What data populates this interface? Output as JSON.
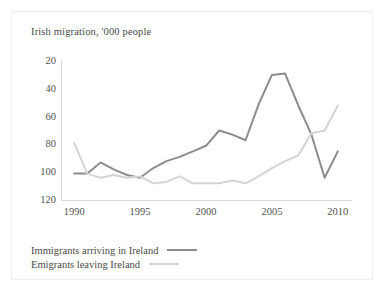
{
  "figure": {
    "title": "Irish migration, '000 people"
  },
  "legend": {
    "items": [
      {
        "label": "Immigrants arriving in Ireland",
        "color": "#8e8c8a",
        "swatch": "thick-line-swatch"
      },
      {
        "label": "Emigrants leaving Ireland",
        "color": "#d6d4d1",
        "swatch": "thin-line-swatch"
      }
    ]
  },
  "chart_data": {
    "type": "line",
    "title": "Irish migration, '000 people",
    "xlabel": "",
    "ylabel": "",
    "xlim": [
      1989,
      2011
    ],
    "ylim": [
      20,
      120
    ],
    "xticks": [
      1990,
      1995,
      2000,
      2005,
      2010
    ],
    "yticks": [
      20,
      40,
      60,
      80,
      100,
      120
    ],
    "grid": false,
    "legend_position": "below-plot-left",
    "x": [
      1990,
      1991,
      1992,
      1993,
      1994,
      1995,
      1996,
      1997,
      1998,
      1999,
      2000,
      2001,
      2002,
      2003,
      2004,
      2005,
      2006,
      2007,
      2008,
      2009,
      2010
    ],
    "series": [
      {
        "name": "Immigrants arriving in Ireland",
        "color": "#8e8c8a",
        "width": 2,
        "values": [
          39,
          39,
          47,
          42,
          38,
          36,
          43,
          48,
          51,
          55,
          59,
          70,
          67,
          63,
          89,
          110,
          111,
          88,
          67,
          36,
          55
        ]
      },
      {
        "name": "Emigrants leaving Ireland",
        "color": "#d6d4d1",
        "width": 2,
        "values": [
          61,
          39,
          36,
          38,
          36,
          37,
          32,
          33,
          37,
          32,
          32,
          32,
          34,
          32,
          37,
          43,
          48,
          52,
          68,
          70,
          88
        ]
      }
    ]
  },
  "axes": {
    "y_tick_labels": [
      "120",
      "100",
      "80",
      "60",
      "40",
      "20"
    ],
    "x_tick_labels": [
      "1990",
      "1995",
      "2000",
      "2005",
      "2010"
    ]
  }
}
